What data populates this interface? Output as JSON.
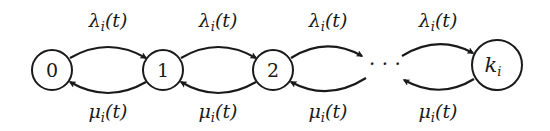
{
  "diagram": {
    "type": "birth-death chain",
    "nodes": [
      {
        "id": "0",
        "label": "0",
        "italic": false
      },
      {
        "id": "1",
        "label": "1",
        "italic": false
      },
      {
        "id": "2",
        "label": "2",
        "italic": false
      },
      {
        "id": "ellipsis",
        "label": "· · ·"
      },
      {
        "id": "k",
        "label": "k",
        "subscript": "i",
        "italic": true
      }
    ],
    "forward_label": {
      "symbol": "λ",
      "subscript": "i",
      "arg": "(t)"
    },
    "backward_label": {
      "symbol": "μ",
      "subscript": "i",
      "arg": "(t)"
    },
    "edges": [
      {
        "from": "0",
        "to": "1",
        "direction": "forward",
        "label": "λ_i(t)"
      },
      {
        "from": "1",
        "to": "0",
        "direction": "backward",
        "label": "μ_i(t)"
      },
      {
        "from": "1",
        "to": "2",
        "direction": "forward",
        "label": "λ_i(t)"
      },
      {
        "from": "2",
        "to": "1",
        "direction": "backward",
        "label": "μ_i(t)"
      },
      {
        "from": "2",
        "to": "ellipsis",
        "direction": "forward",
        "label": "λ_i(t)"
      },
      {
        "from": "ellipsis",
        "to": "2",
        "direction": "backward",
        "label": "μ_i(t)"
      },
      {
        "from": "ellipsis",
        "to": "k",
        "direction": "forward",
        "label": "λ_i(t)"
      },
      {
        "from": "k",
        "to": "ellipsis",
        "direction": "backward",
        "label": "μ_i(t)"
      }
    ],
    "colors": {
      "stroke": "#1a1a1a",
      "background": "#ffffff"
    }
  }
}
